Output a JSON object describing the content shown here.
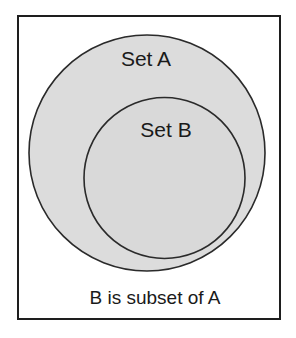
{
  "diagram": {
    "type": "venn-subset",
    "sets": [
      {
        "id": "A",
        "label": "Set A",
        "fill": "#dcdcdc",
        "stroke": "#2a2a2a"
      },
      {
        "id": "B",
        "label": "Set B",
        "fill": "#d9d9d9",
        "stroke": "#2a2a2a"
      }
    ],
    "relation": "B ⊂ A",
    "caption": "B is subset of A"
  },
  "colors": {
    "background": "#ffffff",
    "frame_border": "#1e1e1e",
    "text": "#1a1a1a"
  }
}
